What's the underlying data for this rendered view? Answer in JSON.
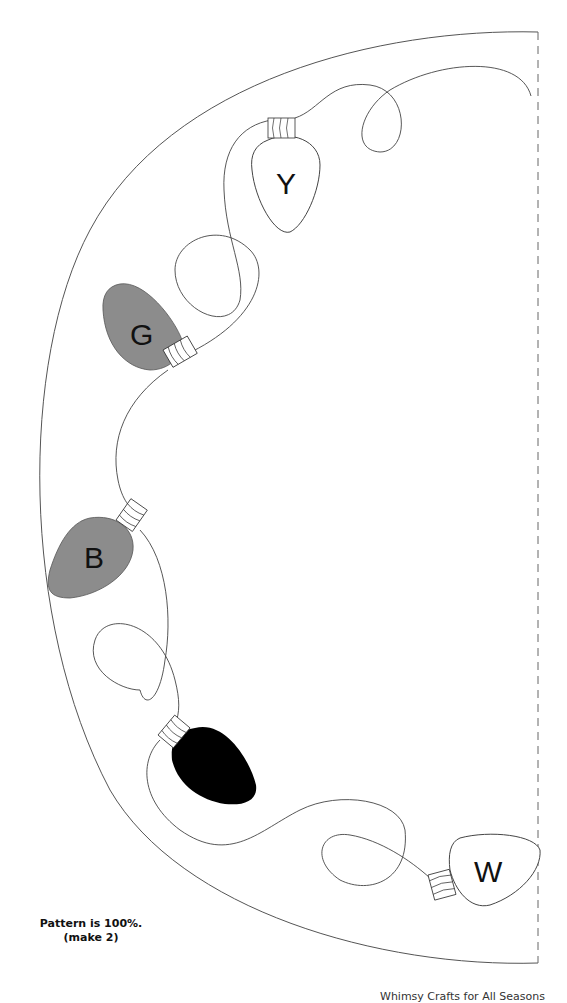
{
  "pattern": {
    "note_line1": "Pattern is 100%.",
    "note_line2": "(make 2)",
    "footer_partial": "Whimsy Crafts for All Seasons",
    "fold_line": "dashed",
    "bulbs": [
      {
        "label": "Y",
        "fill": "#ffffff",
        "color_name": "yellow"
      },
      {
        "label": "G",
        "fill": "#8c8c8c",
        "color_name": "green"
      },
      {
        "label": "B",
        "fill": "#8c8c8c",
        "color_name": "blue"
      },
      {
        "label": "",
        "fill": "#000000",
        "color_name": "black"
      },
      {
        "label": "W",
        "fill": "#ffffff",
        "color_name": "white"
      }
    ]
  }
}
